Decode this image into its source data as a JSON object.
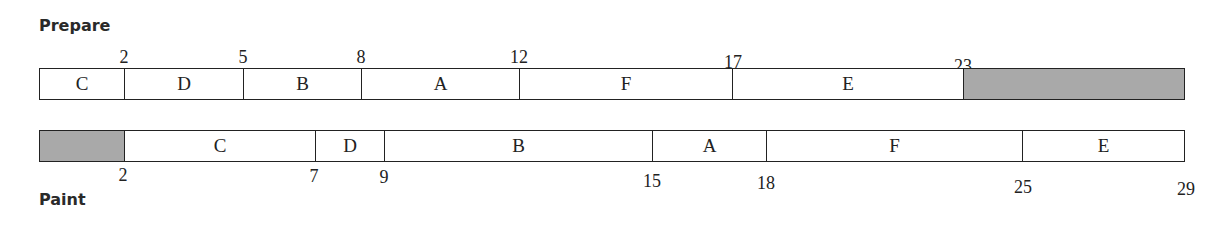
{
  "diagram": {
    "total_units": 29,
    "colors": {
      "idle": "#a9a9a9",
      "task": "#ffffff",
      "border": "#222222"
    },
    "prepare": {
      "label": "Prepare",
      "segments": [
        {
          "label": "C",
          "start": 0,
          "end": 2
        },
        {
          "label": "D",
          "start": 2,
          "end": 5
        },
        {
          "label": "B",
          "start": 5,
          "end": 8
        },
        {
          "label": "A",
          "start": 8,
          "end": 12
        },
        {
          "label": "F",
          "start": 12,
          "end": 17
        },
        {
          "label": "E",
          "start": 17,
          "end": 23
        },
        {
          "label": "",
          "start": 23,
          "end": 29,
          "idle": true
        }
      ],
      "ticks": [
        "2",
        "5",
        "8",
        "12",
        "17",
        "23"
      ]
    },
    "paint": {
      "label": "Paint",
      "segments": [
        {
          "label": "",
          "start": 0,
          "end": 2,
          "idle": true
        },
        {
          "label": "C",
          "start": 2,
          "end": 7
        },
        {
          "label": "D",
          "start": 7,
          "end": 9
        },
        {
          "label": "B",
          "start": 9,
          "end": 15
        },
        {
          "label": "A",
          "start": 15,
          "end": 18
        },
        {
          "label": "F",
          "start": 18,
          "end": 25
        },
        {
          "label": "E",
          "start": 25,
          "end": 29
        }
      ],
      "ticks": [
        "2",
        "7",
        "9",
        "15",
        "18",
        "25",
        "29"
      ]
    }
  }
}
